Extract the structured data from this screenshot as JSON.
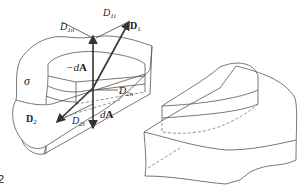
{
  "figure": {
    "number_fragment": "2",
    "left_panel": {
      "surface_label": "σ",
      "labels": {
        "D1": "D",
        "D1_sub": "1",
        "D1t": "D",
        "D1t_sub": "1t",
        "D1n": "D",
        "D1n_sub": "1n",
        "neg_dA_prefix": "−d",
        "neg_dA_vec": "A",
        "D2": "D",
        "D2_sub": "2",
        "D2n": "D",
        "D2n_sub": "2n",
        "D2t": "D",
        "D2t_sub": "2t",
        "dA_prefix": "d",
        "dA_vec": "A"
      }
    },
    "right_panel": {
      "description": "pillbox cylinder straddling interface, without vectors"
    }
  }
}
